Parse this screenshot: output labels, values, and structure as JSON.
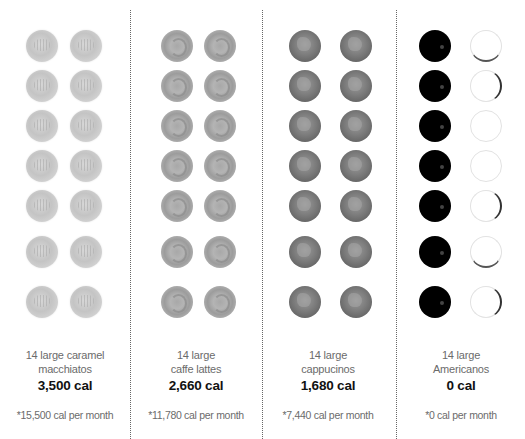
{
  "columns": [
    {
      "drink": "caramel macchiato",
      "cup_style": "caramel",
      "cup_count": 14,
      "label_line1": "14 large caramel",
      "label_line2": "macchiatos",
      "total": "3,500 cal",
      "per_month": "*15,500 cal per month"
    },
    {
      "drink": "caffe latte",
      "cup_style": "latte",
      "cup_count": 14,
      "label_line1": "14 large",
      "label_line2": "caffe lattes",
      "total": "2,660 cal",
      "per_month": "*11,780 cal per month"
    },
    {
      "drink": "cappuccino",
      "cup_style": "capp",
      "cup_count": 14,
      "label_line1": "14 large",
      "label_line2": "cappucinos",
      "total": "1,680 cal",
      "per_month": "*7,440 cal per month"
    },
    {
      "drink": "americano",
      "cup_style": "americano",
      "cup_count": 14,
      "label_line1": "14 large",
      "label_line2": "Americanos",
      "total": "0 cal",
      "per_month": "*0 cal per month"
    }
  ],
  "colors": {
    "background": "#ffffff",
    "label_text": "#6b6b6b",
    "total_text": "#111111",
    "divider": "#666666"
  }
}
